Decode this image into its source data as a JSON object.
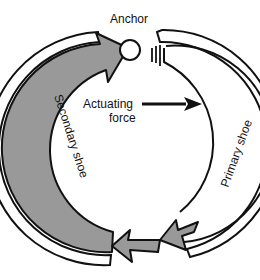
{
  "diagram": {
    "labels": {
      "anchor": "Anchor",
      "actuating_force_line1": "Actuating",
      "actuating_force_line2": "force",
      "primary_shoe": "Primary shoe",
      "secondary_shoe": "Secondary shoe"
    },
    "colors": {
      "shoe_fill": "#999999",
      "outline": "#111111",
      "background": "#ffffff"
    }
  }
}
